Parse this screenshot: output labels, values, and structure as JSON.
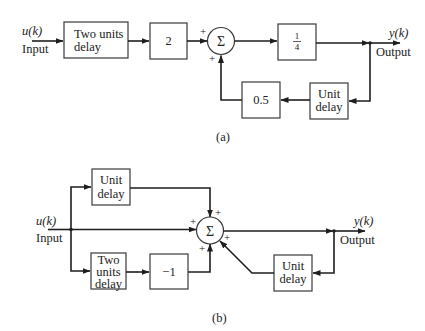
{
  "diagram_a": {
    "caption": "(a)",
    "input_signal": "u(k)",
    "input_label": "Input",
    "output_signal": "y(k)",
    "output_label": "Output",
    "blocks": {
      "two_units_delay_line1": "Two units",
      "two_units_delay_line2": "delay",
      "gain_2": "2",
      "gain_quarter_num": "1",
      "gain_quarter_den": "4",
      "unit_delay_line1": "Unit",
      "unit_delay_line2": "delay",
      "gain_half": "0.5"
    },
    "summer": {
      "symbol": "Σ",
      "sign_top": "+",
      "sign_bottom": "+"
    }
  },
  "diagram_b": {
    "caption": "(b)",
    "input_signal": "u(k)",
    "input_label": "Input",
    "output_signal": "y(k)",
    "output_label": "Output",
    "blocks": {
      "unit_delay_top_line1": "Unit",
      "unit_delay_top_line2": "delay",
      "two_units_delay_line1": "Two",
      "two_units_delay_line2": "units",
      "two_units_delay_line3": "delay",
      "gain_neg1": "−1",
      "unit_delay_fb_line1": "Unit",
      "unit_delay_fb_line2": "delay"
    },
    "summer": {
      "symbol": "Σ",
      "sign_top": "+",
      "sign_left": "+",
      "sign_bottom": "+",
      "sign_lower_right": "+"
    }
  }
}
